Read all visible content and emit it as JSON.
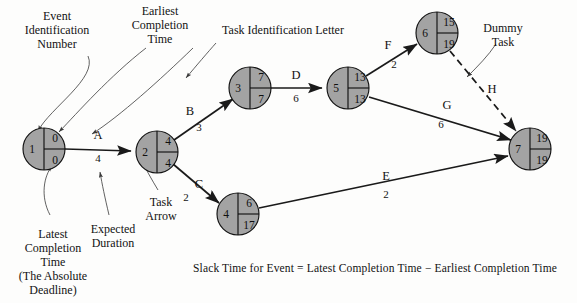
{
  "diagram": {
    "caption": "Slack Time for Event  =  Latest Completion Time  −  Earliest Completion Time",
    "node_fill": "#a3a3a3",
    "line_color": "#1a1a1a"
  },
  "nodes": [
    {
      "id": "1",
      "event": "1",
      "earliest": "0",
      "latest": "0",
      "cx": 44,
      "cy": 149,
      "r": 21
    },
    {
      "id": "2",
      "event": "2",
      "earliest": "4",
      "latest": "4",
      "cx": 157,
      "cy": 152,
      "r": 21
    },
    {
      "id": "3",
      "event": "3",
      "earliest": "7",
      "latest": "7",
      "cx": 250,
      "cy": 88,
      "r": 21
    },
    {
      "id": "4",
      "event": "4",
      "earliest": "6",
      "latest": "17",
      "cx": 238,
      "cy": 214,
      "r": 21
    },
    {
      "id": "5",
      "event": "5",
      "earliest": "13",
      "latest": "13",
      "cx": 348,
      "cy": 88,
      "r": 21
    },
    {
      "id": "6",
      "event": "6",
      "earliest": "15",
      "latest": "19",
      "cx": 437,
      "cy": 33,
      "r": 21
    },
    {
      "id": "7",
      "event": "7",
      "earliest": "19",
      "latest": "19",
      "cx": 530,
      "cy": 149,
      "r": 21
    }
  ],
  "edges": [
    {
      "task": "A",
      "duration": "4",
      "from": "1",
      "to": "2",
      "dummy": false,
      "letter_x": 98,
      "letter_y": 136,
      "dur_x": 98,
      "dur_y": 159
    },
    {
      "task": "B",
      "duration": "3",
      "from": "2",
      "to": "3",
      "dummy": false,
      "letter_x": 190,
      "letter_y": 112,
      "dur_x": 199,
      "dur_y": 128
    },
    {
      "task": "C",
      "duration": "2",
      "from": "2",
      "to": "4",
      "dummy": false,
      "letter_x": 199,
      "letter_y": 185,
      "dur_x": 186,
      "dur_y": 198
    },
    {
      "task": "D",
      "duration": "6",
      "from": "3",
      "to": "5",
      "dummy": false,
      "letter_x": 296,
      "letter_y": 76,
      "dur_x": 296,
      "dur_y": 99
    },
    {
      "task": "E",
      "duration": "2",
      "from": "4",
      "to": "7",
      "dummy": false,
      "letter_x": 386,
      "letter_y": 177,
      "dur_x": 386,
      "dur_y": 195
    },
    {
      "task": "F",
      "duration": "2",
      "from": "5",
      "to": "6",
      "dummy": false,
      "letter_x": 388,
      "letter_y": 46,
      "dur_x": 394,
      "dur_y": 65
    },
    {
      "task": "G",
      "duration": "6",
      "from": "5",
      "to": "7",
      "dummy": false,
      "letter_x": 447,
      "letter_y": 106,
      "dur_x": 441,
      "dur_y": 125
    },
    {
      "task": "H",
      "duration": "",
      "from": "6",
      "to": "7",
      "dummy": true,
      "letter_x": 492,
      "letter_y": 90,
      "dur_x": 0,
      "dur_y": 0
    }
  ],
  "annotations": [
    {
      "key": "event_id",
      "text": "Event\nIdentification\nNumber",
      "x": 57,
      "y": 30
    },
    {
      "key": "earliest",
      "text": "Earliest\nCompletion\nTime",
      "x": 160,
      "y": 24
    },
    {
      "key": "task_letter",
      "text": "Task Identification Letter",
      "x": 283,
      "y": 30
    },
    {
      "key": "dummy_task",
      "text": "Dummy\nTask",
      "x": 503,
      "y": 28
    },
    {
      "key": "latest",
      "text": "Latest\nCompletion\nTime\n(The Absolute\nDeadline)",
      "x": 53,
      "y": 237
    },
    {
      "key": "duration",
      "text": "Expected\nDuration",
      "x": 113,
      "y": 230
    },
    {
      "key": "task_arrow",
      "text": "Task\nArrow",
      "x": 161,
      "y": 203
    }
  ]
}
